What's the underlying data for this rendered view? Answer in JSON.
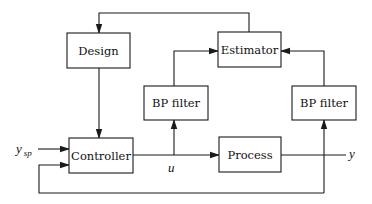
{
  "diagram": {
    "type": "block-diagram",
    "blocks": {
      "design": {
        "label": "Design"
      },
      "estimator": {
        "label": "Estimator"
      },
      "bp_filter_left": {
        "label": "BP filter"
      },
      "bp_filter_right": {
        "label": "BP filter"
      },
      "controller": {
        "label": "Controller"
      },
      "process": {
        "label": "Process"
      }
    },
    "signals": {
      "setpoint": {
        "base": "y",
        "subscript": "sp"
      },
      "control": {
        "label": "u"
      },
      "output": {
        "label": "y"
      }
    },
    "connections": [
      {
        "from": "setpoint",
        "to": "controller"
      },
      {
        "from": "controller",
        "to": "process",
        "signal": "u"
      },
      {
        "from": "process",
        "to": "output",
        "signal": "y"
      },
      {
        "from": "u",
        "to": "bp_filter_left"
      },
      {
        "from": "bp_filter_left",
        "to": "estimator"
      },
      {
        "from": "y",
        "to": "bp_filter_right"
      },
      {
        "from": "bp_filter_right",
        "to": "estimator"
      },
      {
        "from": "estimator",
        "to": "design"
      },
      {
        "from": "design",
        "to": "controller"
      },
      {
        "from": "y",
        "to": "controller",
        "note": "feedback"
      }
    ],
    "colors": {
      "stroke": "#1a1a1a",
      "background": "#ffffff"
    }
  }
}
